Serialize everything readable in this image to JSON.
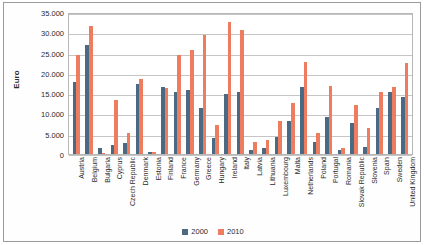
{
  "chart_data": {
    "type": "bar",
    "title": "",
    "xlabel": "",
    "ylabel": "Euro",
    "ylim": [
      0,
      35000
    ],
    "ytick_labels": [
      "0",
      "5.000",
      "10.000",
      "15.000",
      "20.000",
      "25.000",
      "30.000",
      "35.000"
    ],
    "ytick_values": [
      0,
      5000,
      10000,
      15000,
      20000,
      25000,
      30000,
      35000
    ],
    "grid": true,
    "legend_position": "bottom",
    "categories": [
      "Austria",
      "Belgium",
      "Bulgaria",
      "Cyprus",
      "Czech Republic",
      "Denmark",
      "Estonia",
      "Finland",
      "France",
      "Germany",
      "Greece",
      "Hungary",
      "Ireland",
      "Italy",
      "Latvia",
      "Lithuania",
      "Luxembourg",
      "Malta",
      "Netherlands",
      "Poland",
      "Portugal",
      "Romania",
      "Slovak Republic",
      "Slovenia",
      "Spain",
      "Sweden",
      "United Kingdom"
    ],
    "series": [
      {
        "name": "2000",
        "color": "#4A6A84",
        "values": [
          17800,
          26900,
          1400,
          2100,
          2600,
          17200,
          500,
          16500,
          15200,
          15800,
          11400,
          4000,
          14900,
          15200,
          1100,
          1500,
          4300,
          8200,
          16400,
          2900,
          9100,
          1000,
          7700,
          1700,
          11300,
          15400,
          14000
        ]
      },
      {
        "name": "2010",
        "color": "#ED7D5E",
        "values": [
          24500,
          31500,
          300,
          13300,
          5100,
          18500,
          600,
          16200,
          24400,
          25600,
          29300,
          7100,
          32600,
          30600,
          3000,
          3400,
          8200,
          12500,
          22700,
          5300,
          16700,
          1400,
          12000,
          6500,
          15200,
          16400,
          22400
        ]
      }
    ]
  },
  "legend": {
    "items": [
      {
        "label": "2000"
      },
      {
        "label": "2010"
      }
    ]
  }
}
